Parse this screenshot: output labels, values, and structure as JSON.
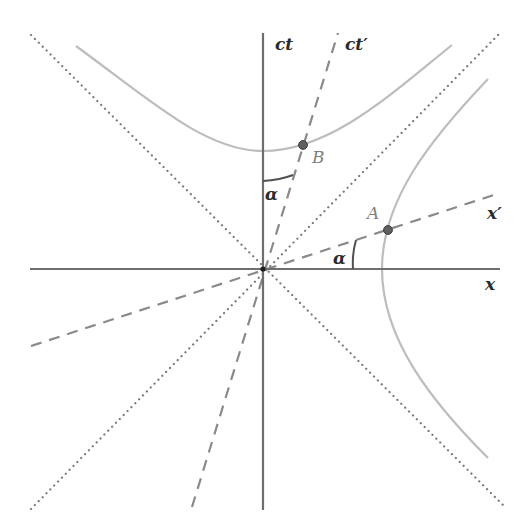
{
  "diagram": {
    "colors": {
      "axis": "#6e6e6e",
      "light_cone": "#7a7a7a",
      "boosted_axis": "#8a8a8a",
      "hyperbola": "#bdbdbd",
      "point_fill": "#606060",
      "angle_arc": "#505050"
    },
    "axes": {
      "time_label": "ct",
      "space_label": "x",
      "boosted_time_label": "ct′",
      "boosted_space_label": "x′"
    },
    "points": [
      {
        "id": "A",
        "label": "A",
        "on": "spacelike hyperbola ∩ x′ axis"
      },
      {
        "id": "B",
        "label": "B",
        "on": "timelike hyperbola ∩ ct′ axis"
      }
    ],
    "angles": [
      {
        "label": "α",
        "between": "ct and ct′"
      },
      {
        "label": "α",
        "between": "x and x′"
      }
    ],
    "lines": {
      "light_cone": "dotted",
      "boosted_axes": "dashed",
      "hyperbolas": "solid light gray"
    }
  }
}
